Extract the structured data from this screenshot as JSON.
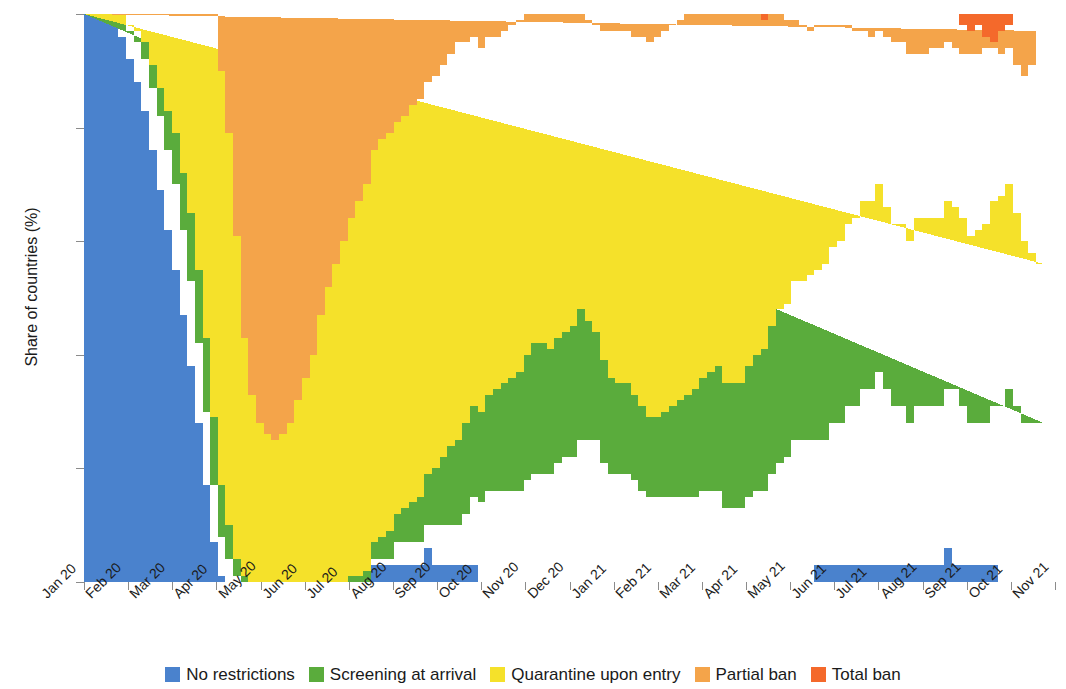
{
  "chart_data": {
    "type": "area",
    "stacked": true,
    "title": "",
    "xlabel": "",
    "ylabel": "Share of countries (%)",
    "ylim": [
      0,
      100
    ],
    "yticks": [
      0,
      20,
      40,
      60,
      80,
      100
    ],
    "grid": false,
    "legend_position": "bottom",
    "x_tick_labels": [
      "Jan 20",
      "Feb 20",
      "Mar 20",
      "Apr 20",
      "May 20",
      "Jun 20",
      "Jul 20",
      "Aug 20",
      "Sep 20",
      "Oct 20",
      "Nov 20",
      "Dec 20",
      "Jan 21",
      "Feb 21",
      "Mar 21",
      "Apr 21",
      "May 21",
      "Jun 21",
      "Jul 21",
      "Aug 21",
      "Sep 21",
      "Oct 21",
      "Nov 21"
    ],
    "series": [
      {
        "name": "No restrictions",
        "color": "#4a82cd",
        "values": [
          100,
          100,
          100,
          100,
          99,
          96,
          92,
          88,
          83,
          76,
          69,
          62,
          55,
          47,
          38,
          28,
          17,
          7,
          1,
          0,
          0,
          0,
          0,
          0,
          0,
          0,
          0,
          0,
          0,
          0,
          0,
          0,
          0,
          0,
          0,
          0,
          0,
          0,
          3,
          3,
          3,
          3,
          3,
          3,
          3,
          6,
          3,
          3,
          3,
          3,
          3,
          3,
          0,
          0,
          0,
          0,
          0,
          0,
          0,
          0,
          0,
          0,
          0,
          0,
          0,
          0,
          0,
          0,
          0,
          0,
          0,
          0,
          0,
          0,
          0,
          0,
          0,
          0,
          0,
          0,
          0,
          0,
          0,
          0,
          0,
          0,
          0,
          0,
          0,
          0,
          0,
          0,
          0,
          0,
          0,
          0,
          3,
          3,
          3,
          3,
          3,
          3,
          3,
          3,
          3,
          3,
          3,
          3,
          3,
          3,
          3,
          3,
          3,
          6,
          3,
          3,
          3,
          3,
          3,
          3,
          0,
          0,
          0,
          0,
          0,
          0,
          0,
          0
        ]
      },
      {
        "name": "Screening at arrival",
        "color": "#5aac3c",
        "values": [
          0,
          0,
          0,
          0,
          1,
          3,
          5,
          7,
          9,
          11,
          13,
          14,
          15,
          15,
          15,
          14,
          13,
          10,
          7,
          4,
          1,
          0,
          0,
          0,
          0,
          0,
          0,
          0,
          0,
          0,
          0,
          0,
          0,
          0,
          0,
          0,
          0,
          0,
          1,
          1,
          1,
          4,
          4,
          4,
          4,
          4,
          7,
          7,
          7,
          7,
          9,
          12,
          14,
          16,
          16,
          16,
          16,
          16,
          18,
          19,
          19,
          19,
          21,
          22,
          22,
          25,
          25,
          25,
          21,
          19,
          19,
          19,
          18,
          16,
          15,
          15,
          15,
          15,
          15,
          15,
          15,
          16,
          16,
          16,
          13,
          13,
          13,
          15,
          16,
          16,
          19,
          21,
          22,
          25,
          25,
          25,
          22,
          22,
          25,
          25,
          28,
          28,
          31,
          31,
          34,
          31,
          28,
          28,
          25,
          28,
          28,
          28,
          28,
          28,
          31,
          28,
          25,
          25,
          25,
          28,
          31,
          34,
          31,
          28,
          28,
          28
        ]
      },
      {
        "name": "Quarantine upon entry",
        "color": "#f5e12a",
        "values": [
          0,
          0,
          0,
          0,
          0,
          1,
          1,
          2,
          3,
          4,
          5,
          7,
          9,
          10,
          12,
          13,
          13,
          12,
          9,
          6,
          3,
          1,
          0,
          0,
          0,
          0,
          0,
          0,
          0,
          0,
          0,
          0,
          0,
          0,
          0,
          1,
          1,
          2,
          3,
          4,
          5,
          5,
          6,
          7,
          8,
          9,
          10,
          12,
          14,
          15,
          16,
          16,
          16,
          17,
          18,
          19,
          20,
          21,
          22,
          23,
          23,
          22,
          22,
          22,
          23,
          23,
          21,
          19,
          18,
          17,
          16,
          16,
          15,
          15,
          14,
          14,
          15,
          16,
          17,
          18,
          19,
          20,
          21,
          22,
          22,
          22,
          22,
          23,
          24,
          25,
          26,
          27,
          27,
          28,
          28,
          29,
          30,
          31,
          31,
          32,
          32,
          33,
          33,
          33,
          33,
          32,
          32,
          32,
          32,
          33,
          33,
          33,
          33,
          33,
          32,
          33,
          33,
          34,
          35,
          36,
          37,
          36,
          34,
          32,
          30,
          28
        ]
      },
      {
        "name": "Partial ban",
        "color": "#f4a44a",
        "values": [
          0,
          0,
          0,
          0,
          0,
          0,
          2,
          3,
          5,
          9,
          13,
          17,
          21,
          28,
          35,
          45,
          57,
          71,
          73,
          69,
          57,
          42,
          33,
          28,
          26,
          25,
          26,
          28,
          32,
          36,
          40,
          47,
          52,
          56,
          60,
          63,
          66,
          68,
          69,
          70,
          70,
          69,
          69,
          70,
          70,
          69,
          69,
          69,
          69,
          70,
          67,
          65,
          64,
          63,
          62,
          62,
          62,
          62,
          60,
          58,
          58,
          59,
          58,
          57,
          56,
          53,
          53,
          54,
          58,
          61,
          62,
          62,
          63,
          65,
          66,
          67,
          67,
          67,
          67,
          67,
          67,
          66,
          64,
          63,
          66,
          66,
          65,
          62,
          60,
          58,
          56,
          52,
          50,
          46,
          45,
          43,
          43,
          42,
          39,
          38,
          35,
          33,
          30,
          29,
          27,
          30,
          32,
          32,
          33,
          29,
          29,
          30,
          30,
          28,
          28,
          29,
          32,
          31,
          31,
          27,
          25,
          24,
          26,
          29,
          33,
          41
        ]
      },
      {
        "name": "Total ban",
        "color": "#f4692b",
        "values": [
          0,
          0,
          0,
          0,
          0,
          0,
          0,
          0,
          0,
          0,
          0,
          0,
          0,
          0,
          0,
          0,
          0,
          0,
          10,
          21,
          39,
          57,
          67,
          72,
          74,
          75,
          74,
          72,
          68,
          64,
          60,
          53,
          48,
          44,
          40,
          36,
          33,
          30,
          24,
          22,
          21,
          19,
          18,
          16,
          15,
          12,
          11,
          9,
          7,
          5,
          5,
          4,
          6,
          4,
          4,
          3,
          2,
          1,
          0,
          0,
          0,
          0,
          -1,
          -1,
          -1,
          -1,
          1,
          2,
          3,
          3,
          3,
          3,
          4,
          4,
          5,
          4,
          3,
          2,
          1,
          0,
          -1,
          -1,
          -1,
          -1,
          -1,
          0,
          0,
          1,
          1,
          0,
          0,
          1,
          1,
          2,
          3,
          4,
          5,
          5,
          7,
          7,
          7,
          7,
          7,
          7,
          7,
          6,
          7,
          10,
          10,
          9,
          7,
          10,
          12,
          9,
          8,
          5,
          4,
          5,
          2,
          1,
          4,
          4,
          9,
          11,
          9,
          3
        ]
      }
    ]
  },
  "legend": {
    "items": [
      {
        "label": "No restrictions",
        "color": "#4a82cd",
        "icon": "legend-swatch-icon"
      },
      {
        "label": "Screening at arrival",
        "color": "#5aac3c",
        "icon": "legend-swatch-icon"
      },
      {
        "label": "Quarantine upon entry",
        "color": "#f5e12a",
        "icon": "legend-swatch-icon"
      },
      {
        "label": "Partial ban",
        "color": "#f4a44a",
        "icon": "legend-swatch-icon"
      },
      {
        "label": "Total ban",
        "color": "#f4692b",
        "icon": "legend-swatch-icon"
      }
    ]
  },
  "axes": {
    "y_title": "Share of countries (%)",
    "y_tick_labels": [
      "0",
      "20",
      "40",
      "60",
      "80",
      "100"
    ],
    "x_tick_labels": [
      "Jan 20",
      "Feb 20",
      "Mar 20",
      "Apr 20",
      "May 20",
      "Jun 20",
      "Jul 20",
      "Aug 20",
      "Sep 20",
      "Oct 20",
      "Nov 20",
      "Dec 20",
      "Jan 21",
      "Feb 21",
      "Mar 21",
      "Apr 21",
      "May 21",
      "Jun 21",
      "Jul 21",
      "Aug 21",
      "Sep 21",
      "Oct 21",
      "Nov 21"
    ]
  }
}
